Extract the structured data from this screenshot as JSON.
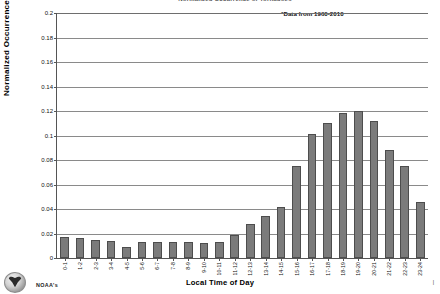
{
  "title": "Normalized Occurrence of Tornadoes",
  "annotation": "*Data from 1960-2010",
  "footer": {
    "logo_name": "noaa-seal-logo",
    "caption": "NOAA's",
    "corner_mark": "|"
  },
  "chart_data": {
    "type": "bar",
    "title": "Normalized Occurrence of Tornadoes",
    "xlabel": "Local Time of Day",
    "ylabel": "Normalized Occurrence",
    "ylim": [
      0,
      0.2
    ],
    "ytick_step": 0.02,
    "yticks": [
      "0",
      "0.02",
      "0.04",
      "0.06",
      "0.08",
      "0.1",
      "0.12",
      "0.14",
      "0.16",
      "0.18",
      "0.2"
    ],
    "grid": true,
    "legend": "none",
    "annotation": "*Data from 1960-2010",
    "bar_color": "#7b7b7b",
    "bar_edge_color": "#4d4d4d",
    "categories": [
      "0-1",
      "1-2",
      "2-3",
      "3-4",
      "4-5",
      "5-6",
      "6-7",
      "7-8",
      "8-9",
      "9-10",
      "10-11",
      "11-12",
      "12-13",
      "13-14",
      "14-15",
      "15-16",
      "16-17",
      "17-18",
      "18-19",
      "19-20",
      "20-21",
      "21-22",
      "22-23",
      "23-24"
    ],
    "values": [
      0.017,
      0.016,
      0.015,
      0.014,
      0.009,
      0.013,
      0.013,
      0.013,
      0.013,
      0.012,
      0.013,
      0.019,
      0.028,
      0.034,
      0.042,
      0.075,
      0.101,
      0.11,
      0.118,
      0.12,
      0.112,
      0.088,
      0.075,
      0.046
    ]
  }
}
